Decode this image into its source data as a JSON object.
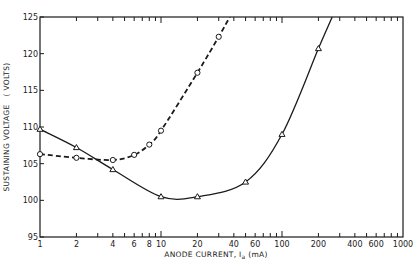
{
  "chart_data": {
    "type": "line",
    "title": "",
    "xlabel": "ANODE CURRENT, Iₐ (mA)",
    "xlabel_parts": {
      "prefix": "ANODE CURRENT, I",
      "subscript": "a",
      "suffix": " (mA)"
    },
    "ylabel": "SUSTAINING VOLTAGE (VOLTS)",
    "ylabel_parts": {
      "main": "SUSTAINING VOLTAGE",
      "unit": "( VOLTS)"
    },
    "xscale": "log",
    "xlim": [
      1,
      1000
    ],
    "ylim": [
      95,
      125
    ],
    "grid": false,
    "legend": "none",
    "x_tick_labels": [
      {
        "v": 1,
        "label": "1"
      },
      {
        "v": 2,
        "label": "2"
      },
      {
        "v": 4,
        "label": "4"
      },
      {
        "v": 6,
        "label": "6"
      },
      {
        "v": 8,
        "label": "8"
      },
      {
        "v": 10,
        "label": "10"
      },
      {
        "v": 20,
        "label": "20"
      },
      {
        "v": 40,
        "label": "40"
      },
      {
        "v": 60,
        "label": "60"
      },
      {
        "v": 100,
        "label": "100"
      },
      {
        "v": 200,
        "label": "200"
      },
      {
        "v": 400,
        "label": "400"
      },
      {
        "v": 600,
        "label": "600"
      },
      {
        "v": 1000,
        "label": "1000"
      }
    ],
    "x_minor_ticks": [
      3,
      5,
      7,
      9,
      30,
      50,
      70,
      80,
      90,
      300,
      500,
      700,
      800,
      900
    ],
    "y_ticks": [
      95,
      100,
      105,
      110,
      115,
      120,
      125
    ],
    "series": [
      {
        "name": "triangle-solid",
        "marker": "triangle",
        "line_style": "solid",
        "points": [
          {
            "x": 1,
            "y": 109.7
          },
          {
            "x": 2,
            "y": 107.2
          },
          {
            "x": 4,
            "y": 104.2
          },
          {
            "x": 10,
            "y": 100.5
          },
          {
            "x": 20,
            "y": 100.5
          },
          {
            "x": 50,
            "y": 102.5
          },
          {
            "x": 100,
            "y": 109.0
          },
          {
            "x": 200,
            "y": 120.7
          }
        ],
        "curve_extends_to": {
          "x": 260,
          "y": 125
        }
      },
      {
        "name": "circle-dashed",
        "marker": "circle",
        "line_style": "dashed",
        "points": [
          {
            "x": 1,
            "y": 106.3
          },
          {
            "x": 2,
            "y": 105.8
          },
          {
            "x": 4,
            "y": 105.5
          },
          {
            "x": 6,
            "y": 106.2
          },
          {
            "x": 8,
            "y": 107.6
          },
          {
            "x": 10,
            "y": 109.5
          },
          {
            "x": 20,
            "y": 117.4
          },
          {
            "x": 30,
            "y": 122.3
          }
        ],
        "curve_extends_to": {
          "x": 37,
          "y": 125
        }
      }
    ]
  },
  "colors": {
    "ink": "#1a1a1a",
    "background": "#ffffff"
  }
}
